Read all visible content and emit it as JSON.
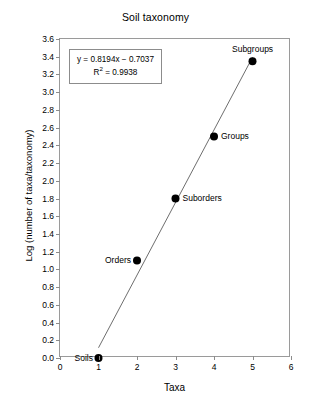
{
  "chart_data": {
    "type": "scatter",
    "title": "Soil taxonomy",
    "xlabel": "Taxa",
    "ylabel": "Log (number of taxa/taxonomy)",
    "xlim": [
      0,
      6
    ],
    "ylim": [
      0.0,
      3.6
    ],
    "xticks": [
      "0",
      "1",
      "2",
      "3",
      "4",
      "5",
      "6"
    ],
    "xtick_values": [
      0,
      1,
      2,
      3,
      4,
      5,
      6
    ],
    "yticks": [
      "0.0",
      "0.2",
      "0.4",
      "0.6",
      "0.8",
      "1.0",
      "1.2",
      "1.4",
      "1.6",
      "1.8",
      "2.0",
      "2.2",
      "2.4",
      "2.6",
      "2.8",
      "3.0",
      "3.2",
      "3.4",
      "3.6"
    ],
    "ytick_values": [
      0.0,
      0.2,
      0.4,
      0.6,
      0.8,
      1.0,
      1.2,
      1.4,
      1.6,
      1.8,
      2.0,
      2.2,
      2.4,
      2.6,
      2.8,
      3.0,
      3.2,
      3.4,
      3.6
    ],
    "grid": false,
    "legend": null,
    "x": [
      1,
      2,
      3,
      4,
      5
    ],
    "y": [
      0.0,
      1.1,
      1.8,
      2.5,
      3.35
    ],
    "point_labels": [
      "Soils",
      "Orders",
      "Suborders",
      "Groups",
      "Subgroups"
    ],
    "points": [
      {
        "label": "Soils",
        "x": 1,
        "y": 0.0,
        "label_side": "left"
      },
      {
        "label": "Orders",
        "x": 2,
        "y": 1.1,
        "label_side": "left"
      },
      {
        "label": "Suborders",
        "x": 3,
        "y": 1.8,
        "label_side": "right"
      },
      {
        "label": "Groups",
        "x": 4,
        "y": 2.5,
        "label_side": "right"
      },
      {
        "label": "Subgroups",
        "x": 5,
        "y": 3.35,
        "label_side": "above"
      }
    ],
    "trendline": {
      "slope": 0.8194,
      "intercept": -0.7037,
      "r_squared": 0.9938,
      "equation_text": "y = 0.8194x − 0.7037",
      "r2_prefix": "R",
      "r2_exponent": "2",
      "r2_text": " = 0.9938",
      "x_start": 1,
      "x_end": 5
    },
    "colors": {
      "marker": "#000000",
      "line": "#6e6e6e",
      "axis": "#9a9a9a",
      "text": "#000000",
      "background": "#ffffff"
    }
  }
}
